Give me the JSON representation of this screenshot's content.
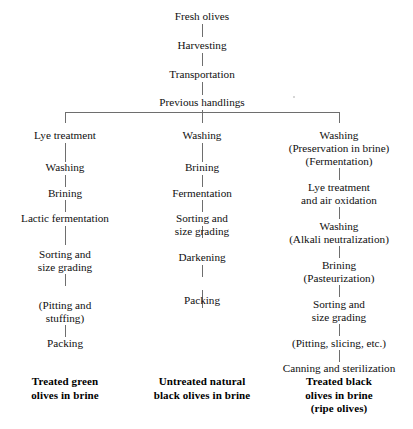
{
  "diagram": {
    "line_color": "#6e6e6e",
    "text_color": "#0f0f0f",
    "background": "#ffffff"
  },
  "trunk": [
    {
      "id": "fresh-olives",
      "label": "Fresh olives"
    },
    {
      "id": "harvesting",
      "label": "Harvesting"
    },
    {
      "id": "transportation",
      "label": "Transportation"
    },
    {
      "id": "previous-handlings",
      "label": "Previous handlings"
    }
  ],
  "branches": {
    "left": {
      "id": "treated-green-olives",
      "steps": [
        {
          "id": "lye-treatment",
          "line1": "Lye treatment"
        },
        {
          "id": "washing",
          "line1": "Washing"
        },
        {
          "id": "brining",
          "line1": "Brining"
        },
        {
          "id": "lactic-fermentation",
          "line1": "Lactic fermentation"
        },
        {
          "id": "sorting-size-grading",
          "line1": "Sorting and",
          "line2": "size grading"
        },
        {
          "id": "pitting-stuffing",
          "line1": "(Pitting and",
          "line2": "stuffing)"
        },
        {
          "id": "packing",
          "line1": "Packing"
        }
      ],
      "terminal": {
        "line1": "Treated green",
        "line2": "olives in brine"
      }
    },
    "middle": {
      "id": "untreated-natural-black-olives",
      "steps": [
        {
          "id": "washing",
          "line1": "Washing"
        },
        {
          "id": "brining",
          "line1": "Brining"
        },
        {
          "id": "fermentation",
          "line1": "Fermentation"
        },
        {
          "id": "sorting-size-grading",
          "line1": "Sorting and",
          "line2": "size grading"
        },
        {
          "id": "darkening",
          "line1": "Darkening"
        },
        {
          "id": "packing",
          "line1": "Packing"
        }
      ],
      "terminal": {
        "line1": "Untreated natural",
        "line2": "black olives in brine"
      }
    },
    "right": {
      "id": "treated-black-olives",
      "steps": [
        {
          "id": "washing-preservation",
          "line1": "Washing",
          "line2": "(Preservation in brine)",
          "line3": "(Fermentation)"
        },
        {
          "id": "lye-treatment-air-oxidation",
          "line1": "Lye treatment",
          "line2": "and air oxidation"
        },
        {
          "id": "washing-alkali",
          "line1": "Washing",
          "line2": "(Alkali neutralization)"
        },
        {
          "id": "brining-pasteurization",
          "line1": "Brining",
          "line2": "(Pasteurization)"
        },
        {
          "id": "sorting-size-grading",
          "line1": "Sorting and",
          "line2": "size grading"
        },
        {
          "id": "pitting-slicing",
          "line1": "(Pitting, slicing, etc.)"
        },
        {
          "id": "canning-sterilization",
          "line1": "Canning and sterilization"
        }
      ],
      "terminal": {
        "line1": "Treated black",
        "line2": "olives in brine",
        "line3": "(ripe olives)"
      }
    }
  }
}
